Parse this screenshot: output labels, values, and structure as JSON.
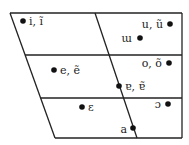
{
  "diagram": {
    "type": "vowel-trapezoid",
    "line_color": "#222222",
    "dot_color": "#111111",
    "vowels": [
      {
        "label": "i, ĩ",
        "dot": [
          23,
          21
        ],
        "text": [
          29,
          25
        ],
        "anchor": "start"
      },
      {
        "label": "u, ũ",
        "dot": [
          170,
          24
        ],
        "text": [
          163,
          28
        ],
        "anchor": "end"
      },
      {
        "label": "ɯ",
        "dot": [
          140,
          38
        ],
        "text": [
          132,
          42
        ],
        "anchor": "end"
      },
      {
        "label": "e, ẽ",
        "dot": [
          54,
          70
        ],
        "text": [
          60,
          74
        ],
        "anchor": "start"
      },
      {
        "label": "o, õ",
        "dot": [
          169,
          63
        ],
        "text": [
          162,
          67
        ],
        "anchor": "end"
      },
      {
        "label": "ɐ, ɐ̃",
        "dot": [
          119,
          86
        ],
        "text": [
          125,
          90
        ],
        "anchor": "start"
      },
      {
        "label": "ɛ",
        "dot": [
          82,
          107
        ],
        "text": [
          88,
          111
        ],
        "anchor": "start"
      },
      {
        "label": "ɔ",
        "dot": [
          168,
          104
        ],
        "text": [
          161,
          108
        ],
        "anchor": "end"
      },
      {
        "label": "a",
        "dot": [
          133,
          128
        ],
        "text": [
          127,
          133
        ],
        "anchor": "end"
      }
    ]
  }
}
